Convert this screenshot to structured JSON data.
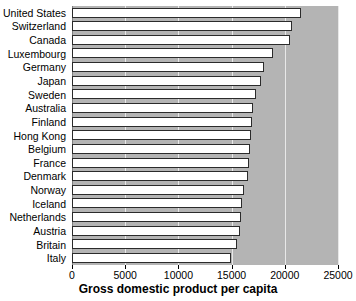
{
  "chart_data": {
    "type": "bar",
    "orientation": "horizontal",
    "title": "",
    "xlabel": "Gross domestic product per capita",
    "ylabel": "",
    "xlim": [
      0,
      25000
    ],
    "xticks": [
      0,
      5000,
      10000,
      15000,
      20000,
      25000
    ],
    "xtick_labels": [
      "0",
      "5000",
      "10000",
      "15000",
      "20000",
      "25000"
    ],
    "grid": true,
    "grid_axis": "x",
    "legend": false,
    "categories": [
      "United States",
      "Switzerland",
      "Canada",
      "Luxembourg",
      "Germany",
      "Japan",
      "Sweden",
      "Australia",
      "Finland",
      "Hong Kong",
      "Belgium",
      "France",
      "Denmark",
      "Norway",
      "Iceland",
      "Netherlands",
      "Austria",
      "Britain",
      "Italy"
    ],
    "values": [
      21500,
      20700,
      20500,
      18900,
      18000,
      17800,
      17300,
      17000,
      16900,
      16800,
      16700,
      16600,
      16500,
      16200,
      16000,
      15900,
      15800,
      15500,
      14900
    ],
    "colors": {
      "bar_face": "#ffffff",
      "bar_edge": "#2b2b2b",
      "plot_background": "#b4b4b4",
      "gridline": "#e8e8e8",
      "figure_background": "#ffffff",
      "text": "#000000"
    }
  }
}
